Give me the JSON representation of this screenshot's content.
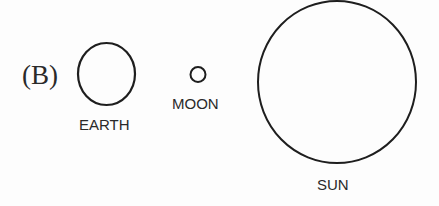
{
  "option_label": "(B)",
  "bodies": [
    {
      "name": "EARTH",
      "cx": 106.5,
      "cy": 74,
      "rx": 28.5,
      "ry": 31
    },
    {
      "name": "MOON",
      "cx": 198,
      "cy": 74.5,
      "rx": 8,
      "ry": 8
    },
    {
      "name": "SUN",
      "cx": 337,
      "cy": 82,
      "rx": 79,
      "ry": 81
    }
  ],
  "labels": {
    "earth": "EARTH",
    "moon": "MOON",
    "sun": "SUN"
  },
  "colors": {
    "stroke": "#1e1e1e",
    "background": "#fdfdfd"
  }
}
